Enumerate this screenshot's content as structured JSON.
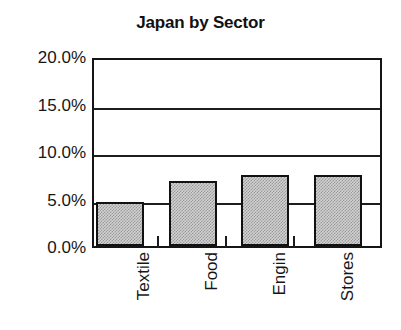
{
  "chart_data": {
    "type": "bar",
    "title": "Japan by Sector",
    "xlabel": "",
    "ylabel": "",
    "categories": [
      "Textile",
      "Food",
      "Engin",
      "Stores"
    ],
    "values": [
      4.6,
      6.8,
      7.5,
      7.5
    ],
    "value_unit": "%",
    "ylim": [
      0,
      20
    ],
    "ytick_values": [
      0,
      5,
      10,
      15,
      20
    ],
    "ytick_labels": [
      "0.0%",
      "5.0%",
      "10.0%",
      "15.0%",
      "20.0%"
    ],
    "gridlines": [
      5,
      10,
      15
    ],
    "grid": true,
    "legend": "none",
    "series": [
      {
        "name": "Japan by Sector",
        "values": [
          4.6,
          6.8,
          7.5,
          7.5
        ],
        "fill": "#c8c8c8",
        "edge": "#111111"
      }
    ]
  },
  "colors": {
    "background": "#ffffff",
    "axis": "#151515",
    "grid": "#1d1d1d",
    "bar_fill": "#d2d2d2",
    "bar_edge": "#111111",
    "text": "#161616"
  }
}
